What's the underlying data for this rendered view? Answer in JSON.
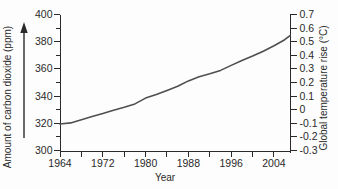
{
  "chart_data": {
    "type": "line",
    "title": "",
    "xlabel": "Year",
    "ylabel_left": "Amount of carbon dioxide (ppm)",
    "ylabel_right": "Global temperature rise (°C)",
    "x_range": [
      1964,
      2007
    ],
    "x_tick_interval": 4,
    "x_tick_label_years": [
      1964,
      1972,
      1980,
      1988,
      1996,
      2004
    ],
    "y_left_range": [
      300,
      400
    ],
    "y_left_tick_interval": 10,
    "y_left_label_values": [
      300,
      320,
      340,
      360,
      380,
      400
    ],
    "y_right_range": [
      -0.3,
      0.7
    ],
    "y_right_tick_values": [
      0.7,
      0.6,
      0.5,
      0.4,
      0.3,
      0.2,
      0.1,
      0,
      -0.1,
      -0.2,
      -0.3
    ],
    "y_right_tick_labels": [
      "0.7",
      "0.6",
      "0.5",
      "0.4",
      "0.3",
      "0.2",
      "0.1",
      "0",
      "-0.1",
      "-0.2",
      "-0.3"
    ],
    "grid": false,
    "legend": false,
    "left_axis_arrow_direction": "up",
    "series": [
      {
        "name": "Carbon dioxide concentration",
        "x": [
          1964,
          1966,
          1968,
          1970,
          1972,
          1974,
          1976,
          1978,
          1980,
          1982,
          1984,
          1986,
          1988,
          1990,
          1992,
          1994,
          1996,
          1998,
          2000,
          2002,
          2004,
          2006,
          2007
        ],
        "y_ppm": [
          319.5,
          320.3,
          322.6,
          325.0,
          327.2,
          329.6,
          331.8,
          334.3,
          338.5,
          341.2,
          344.2,
          347.2,
          351.2,
          354.2,
          356.4,
          358.9,
          362.6,
          366.1,
          369.4,
          373.0,
          377.0,
          381.5,
          384.5
        ]
      }
    ],
    "colors": {
      "line": "#4f4f4f",
      "axis": "#2a2a2a",
      "text": "#2a2a2a",
      "background": "#fdfdfd"
    }
  }
}
